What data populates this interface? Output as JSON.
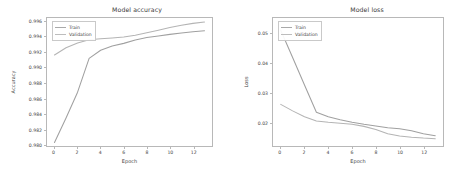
{
  "figure": {
    "background": "#ffffff",
    "line_color_train": "#a0a0a0",
    "line_color_validation": "#b4b4b4",
    "axis_color": "#b8b8b8"
  },
  "chart_data": [
    {
      "type": "line",
      "title": "Model accuracy",
      "xlabel": "Epoch",
      "ylabel": "Accuracy",
      "grid": false,
      "legend_position": "upper left",
      "xlim": [
        -0.65,
        13.65
      ],
      "ylim": [
        0.9798,
        0.99645
      ],
      "xticks": [
        0,
        2,
        4,
        6,
        8,
        10,
        12
      ],
      "xtick_labels": [
        "0",
        "2",
        "4",
        "6",
        "8",
        "10",
        "12"
      ],
      "yticks": [
        0.98,
        0.982,
        0.984,
        0.986,
        0.988,
        0.99,
        0.992,
        0.994,
        0.996
      ],
      "ytick_labels": [
        "0.980",
        "0.982",
        "0.984",
        "0.986",
        "0.988",
        "0.990",
        "0.992",
        "0.994",
        "0.996"
      ],
      "x": [
        0,
        1,
        2,
        3,
        4,
        5,
        6,
        7,
        8,
        9,
        10,
        11,
        12,
        13
      ],
      "series": [
        {
          "name": "Train",
          "values": [
            0.98025,
            0.98345,
            0.9868,
            0.9912,
            0.99225,
            0.9928,
            0.99315,
            0.9936,
            0.9939,
            0.9941,
            0.99432,
            0.9945,
            0.99465,
            0.99478
          ]
        },
        {
          "name": "Validation",
          "values": [
            0.99163,
            0.99258,
            0.9932,
            0.99362,
            0.99375,
            0.99385,
            0.99398,
            0.9942,
            0.99452,
            0.99487,
            0.9952,
            0.9955,
            0.99575,
            0.99592
          ]
        }
      ]
    },
    {
      "type": "line",
      "title": "Model loss",
      "xlabel": "Epoch",
      "ylabel": "Loss",
      "grid": false,
      "legend_position": "upper left",
      "xlim": [
        -0.65,
        13.65
      ],
      "ylim": [
        0.0118,
        0.0555
      ],
      "xticks": [
        0,
        2,
        4,
        6,
        8,
        10,
        12
      ],
      "xtick_labels": [
        "0",
        "2",
        "4",
        "6",
        "8",
        "10",
        "12"
      ],
      "yticks": [
        0.02,
        0.03,
        0.04,
        0.05
      ],
      "ytick_labels": [
        "0.02",
        "0.03",
        "0.04",
        "0.05"
      ],
      "x": [
        0,
        1,
        2,
        3,
        4,
        5,
        6,
        7,
        8,
        9,
        10,
        11,
        12,
        13
      ],
      "series": [
        {
          "name": "Train",
          "values": [
            0.0513,
            0.042,
            0.0326,
            0.0233,
            0.0218,
            0.0208,
            0.0199,
            0.0192,
            0.0186,
            0.018,
            0.0177,
            0.017,
            0.016,
            0.0153
          ]
        },
        {
          "name": "Validation",
          "values": [
            0.026,
            0.0238,
            0.0218,
            0.0203,
            0.0199,
            0.0196,
            0.0192,
            0.0185,
            0.0174,
            0.016,
            0.0152,
            0.0148,
            0.0145,
            0.0143
          ]
        }
      ]
    }
  ]
}
